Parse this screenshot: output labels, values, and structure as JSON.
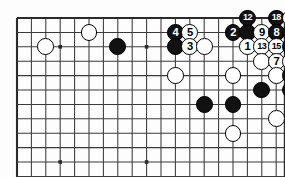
{
  "figure": {
    "kind": "go-board-diagram",
    "title": "",
    "board": {
      "columns": 18,
      "rows": 11,
      "left_px": 17,
      "top_px": 18,
      "cell_px": 14.4,
      "line_color": "#3a3a3a",
      "edge_color": "#2b2b2b",
      "background": "#fdfdfd",
      "star_points": [
        {
          "col": 3,
          "row": 2
        },
        {
          "col": 9,
          "row": 2
        },
        {
          "col": 3,
          "row": 10
        },
        {
          "col": 9,
          "row": 10
        }
      ]
    },
    "colors": {
      "black_stone": "#111111",
      "white_stone": "#ffffff",
      "stone_outline": "#000000",
      "black_label": "#ffffff",
      "white_label": "#000000"
    },
    "stones": [
      {
        "col": 2,
        "row": 2,
        "color": "white",
        "label": ""
      },
      {
        "col": 5,
        "row": 1,
        "color": "white",
        "label": ""
      },
      {
        "col": 7,
        "row": 2,
        "color": "black",
        "label": ""
      },
      {
        "col": 11,
        "row": 1,
        "color": "black",
        "label": "4"
      },
      {
        "col": 12,
        "row": 1,
        "color": "white",
        "label": "5"
      },
      {
        "col": 11,
        "row": 2,
        "color": "black",
        "label": ""
      },
      {
        "col": 12,
        "row": 2,
        "color": "white",
        "label": "3"
      },
      {
        "col": 13,
        "row": 2,
        "color": "white",
        "label": ""
      },
      {
        "col": 15,
        "row": 1,
        "color": "black",
        "label": "2"
      },
      {
        "col": 16,
        "row": 1,
        "color": "black",
        "label": ""
      },
      {
        "col": 16,
        "row": 0,
        "color": "black",
        "label": "12"
      },
      {
        "col": 18,
        "row": 0,
        "color": "black",
        "label": "18"
      },
      {
        "col": 19,
        "row": 0,
        "color": "white",
        "label": "17"
      },
      {
        "col": 20,
        "row": 0,
        "color": "black",
        "label": "14"
      },
      {
        "col": 21,
        "row": 0,
        "color": "white",
        "label": "19"
      },
      {
        "col": 17,
        "row": 1,
        "color": "white",
        "label": "9"
      },
      {
        "col": 18,
        "row": 1,
        "color": "black",
        "label": "8"
      },
      {
        "col": 19,
        "row": 1,
        "color": "black",
        "label": "16"
      },
      {
        "col": 20,
        "row": 1,
        "color": "black",
        "label": "10"
      },
      {
        "col": 21,
        "row": 1,
        "color": "white",
        "label": "11"
      },
      {
        "col": 22,
        "row": 1,
        "color": "white",
        "label": "20"
      },
      {
        "col": 16,
        "row": 2,
        "color": "white",
        "label": "1"
      },
      {
        "col": 17,
        "row": 2,
        "color": "white",
        "label": "13"
      },
      {
        "col": 18,
        "row": 2,
        "color": "white",
        "label": "15"
      },
      {
        "col": 19,
        "row": 2,
        "color": "black",
        "label": "6"
      },
      {
        "col": 20,
        "row": 2,
        "color": "white",
        "label": ""
      },
      {
        "col": 21,
        "row": 2,
        "color": "white",
        "label": ""
      },
      {
        "col": 22,
        "row": 2,
        "color": "white",
        "label": "21"
      },
      {
        "col": 17,
        "row": 3,
        "color": "white",
        "label": ""
      },
      {
        "col": 18,
        "row": 3,
        "color": "white",
        "label": "7"
      },
      {
        "col": 19,
        "row": 3,
        "color": "white",
        "label": ""
      },
      {
        "col": 20,
        "row": 3,
        "color": "black",
        "label": ""
      },
      {
        "col": 21,
        "row": 3,
        "color": "black",
        "label": "22"
      },
      {
        "col": 11,
        "row": 4,
        "color": "white",
        "label": ""
      },
      {
        "col": 15,
        "row": 4,
        "color": "white",
        "label": ""
      },
      {
        "col": 18,
        "row": 4,
        "color": "white",
        "label": ""
      },
      {
        "col": 19,
        "row": 4,
        "color": "black",
        "label": ""
      },
      {
        "col": 20,
        "row": 4,
        "color": "black",
        "label": ""
      },
      {
        "col": 17,
        "row": 5,
        "color": "black",
        "label": ""
      },
      {
        "col": 19,
        "row": 5,
        "color": "black",
        "label": ""
      },
      {
        "col": 20,
        "row": 5,
        "color": "black",
        "label": ""
      },
      {
        "col": 13,
        "row": 6,
        "color": "black",
        "label": ""
      },
      {
        "col": 15,
        "row": 6,
        "color": "black",
        "label": ""
      },
      {
        "col": 20,
        "row": 6,
        "color": "white",
        "label": ""
      },
      {
        "col": 21,
        "row": 6,
        "color": "white",
        "label": ""
      },
      {
        "col": 22,
        "row": 6,
        "color": "black",
        "label": ""
      },
      {
        "col": 18,
        "row": 7,
        "color": "white",
        "label": ""
      },
      {
        "col": 20,
        "row": 7,
        "color": "black",
        "label": ""
      },
      {
        "col": 21,
        "row": 7,
        "color": "black",
        "label": ""
      },
      {
        "col": 22,
        "row": 7,
        "color": "black",
        "label": ""
      },
      {
        "col": 15,
        "row": 8,
        "color": "white",
        "label": ""
      },
      {
        "col": 20,
        "row": 9,
        "color": "white",
        "label": ""
      },
      {
        "col": 22,
        "row": 9,
        "color": "white",
        "label": ""
      }
    ]
  }
}
